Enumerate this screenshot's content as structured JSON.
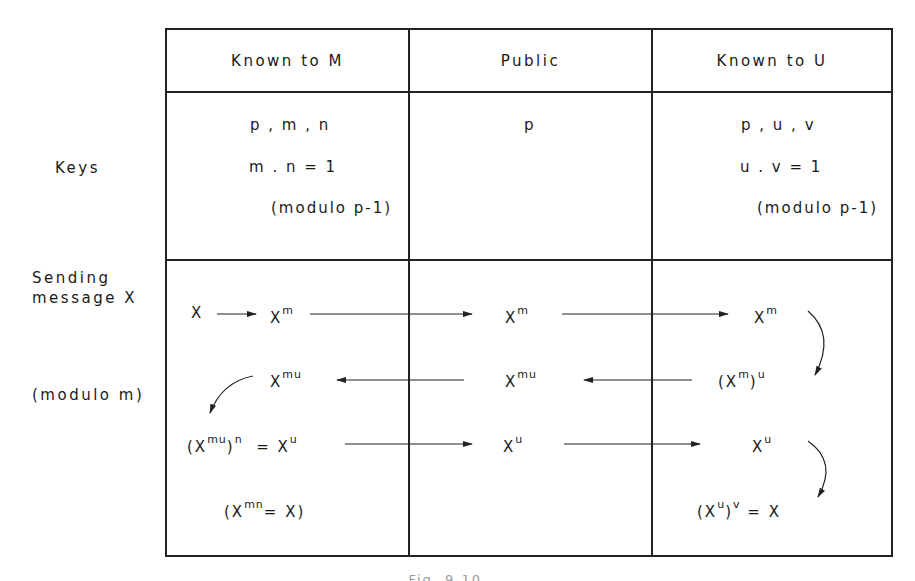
{
  "table": {
    "columns": [
      {
        "header": "Known to M"
      },
      {
        "header": "Public"
      },
      {
        "header": "Known to U"
      }
    ],
    "rows": {
      "keys": {
        "label": "Keys",
        "known_to_m": {
          "line1": "p , m , n",
          "line2": "m . n = 1",
          "line3": "(modulo p-1)"
        },
        "public": {
          "line1": "p"
        },
        "known_to_u": {
          "line1": "p , u , v",
          "line2": "u . v = 1",
          "line3": "(modulo p-1)"
        }
      },
      "sending": {
        "label_line1": "Sending",
        "label_line2": "message X",
        "label_line3": "(modulo m)",
        "steps": [
          {
            "m_side": "X → X^m",
            "public": "X^m",
            "u_side": "X^m",
            "direction": "M→U"
          },
          {
            "m_side": "X^mu",
            "public": "X^mu",
            "u_side": "(X^m)^u",
            "direction": "U→M"
          },
          {
            "m_side": "(X^mu)^n = X^u",
            "public": "X^u",
            "u_side": "X^u",
            "direction": "M→U"
          },
          {
            "m_side": "(X^mn = X)",
            "public": "",
            "u_side": "(X^u)^v = X",
            "direction": "none"
          }
        ],
        "glyphs": {
          "X": "X",
          "m": "m",
          "mu": "mu",
          "n": "n",
          "u": "u",
          "v": "v",
          "mn": "mn",
          "open": "(",
          "close": ")",
          "eq": "=",
          "openclose_eq": "="
        }
      }
    }
  },
  "caption": "Fig. 9.10 ..."
}
